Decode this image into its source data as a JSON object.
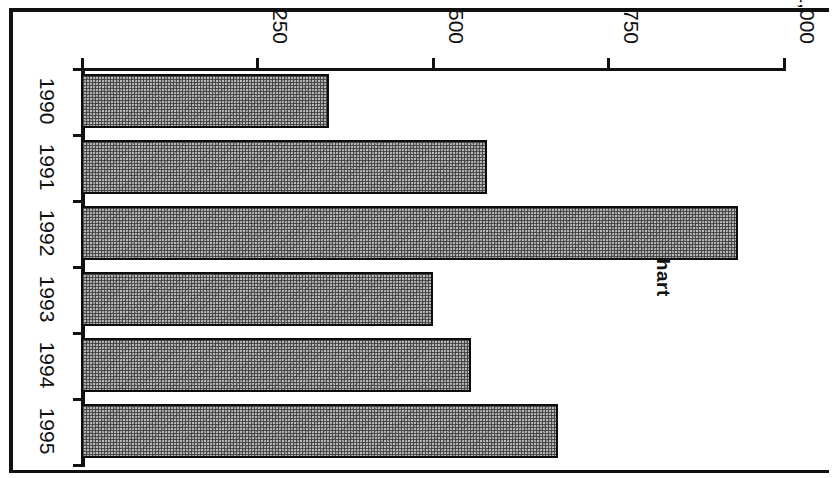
{
  "chart_data": {
    "type": "bar",
    "title": "Bar Chart",
    "orientation": "vertical",
    "page_rotation_degrees": 90,
    "categories": [
      "1990",
      "1991",
      "1992",
      "1993",
      "1994",
      "1995"
    ],
    "values": [
      353,
      579,
      936,
      502,
      556,
      680
    ],
    "xlabel": "",
    "ylabel": "",
    "ylim": [
      0,
      1000
    ],
    "yticks": [
      0,
      250,
      500,
      750,
      1000
    ],
    "ytick_labels": [
      "",
      "250",
      "500",
      "750",
      "1,000"
    ],
    "grid": false,
    "legend": false,
    "bar_fill": "#b9b9b9",
    "bar_edge": "#0c0c0c",
    "axis_color": "#111111",
    "background": "#ffffff"
  },
  "axes": {
    "value_ticks": [
      {
        "label": "1,000",
        "value": 1000
      },
      {
        "label": "750",
        "value": 750
      },
      {
        "label": "500",
        "value": 500
      },
      {
        "label": "250",
        "value": 250
      }
    ],
    "category_ticks": [
      {
        "label": "1990"
      },
      {
        "label": "1991"
      },
      {
        "label": "1992"
      },
      {
        "label": "1993"
      },
      {
        "label": "1994"
      },
      {
        "label": "1995"
      }
    ]
  }
}
